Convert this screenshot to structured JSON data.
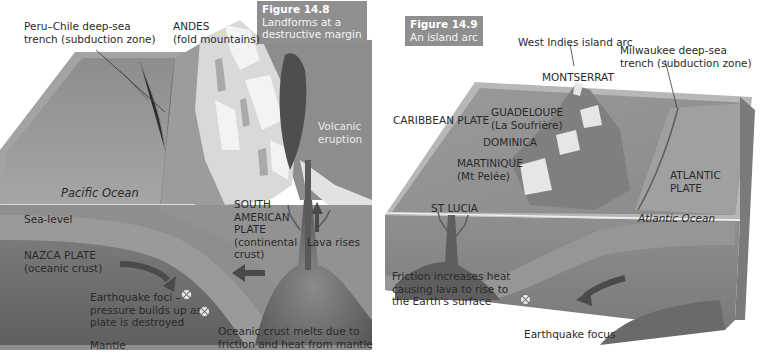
{
  "figures": [
    {
      "number": "Figure 14.8",
      "title": "Landforms at a destructive margin",
      "title_lines": [
        "Landforms at a",
        "destructive margin"
      ],
      "labels": {
        "trench": [
          "Peru–Chile deep-sea",
          "trench (subduction zone)"
        ],
        "andes": [
          "ANDES",
          "(fold mountains)"
        ],
        "volcanic": [
          "Volcanic",
          "eruption"
        ],
        "pacific_ocean": "Pacific Ocean",
        "sea_level": "Sea-level",
        "south_american_plate": [
          "SOUTH",
          "AMERICAN",
          "PLATE",
          "(continental",
          "crust)"
        ],
        "lava_rises": "Lava rises",
        "nazca_plate": [
          "NAZCA PLATE",
          "(oceanic crust)"
        ],
        "earthquake_foci": [
          "Earthquake foci –",
          "pressure builds up as",
          "plate is destroyed"
        ],
        "mantle": "Mantle",
        "oceanic_melts": [
          "Oceanic crust melts due to",
          "friction and heat from mantle"
        ]
      },
      "icons": [
        "earthquake-focus-icon",
        "earthquake-focus-icon",
        "arrow-subduction-icon",
        "arrow-west-icon",
        "arrow-up-icon"
      ]
    },
    {
      "number": "Figure 14.9",
      "title": "An island arc",
      "title_lines": [
        "An island arc"
      ],
      "labels": {
        "west_indies": "West Indies island arc",
        "milwaukee": [
          "Milwaukee deep-sea",
          "trench (subduction zone)"
        ],
        "montserrat": "MONTSERRAT",
        "caribbean_plate": "CARIBBEAN PLATE",
        "guadeloupe": [
          "GUADELOUPE",
          "(La Soufrière)"
        ],
        "dominica": "DOMINICA",
        "martinique": [
          "MARTINIQUE",
          "(Mt Pelée)"
        ],
        "st_lucia": "ST LUCIA",
        "atlantic_plate": [
          "ATLANTIC",
          "PLATE"
        ],
        "atlantic_ocean": "Atlantic Ocean",
        "friction": [
          "Friction increases heat",
          "causing lava to rise to",
          "the Earth's surface"
        ],
        "earthquake_focus": "Earthquake focus"
      },
      "icons": [
        "earthquake-focus-icon",
        "arrow-subduction-icon"
      ]
    }
  ],
  "colors": {
    "ocean_surface": "#9a9a9a",
    "block_side": "#8a8a8a",
    "mantle": "#6f6f6f",
    "caption_bg": "#8f8f8f",
    "snow": "#eeeeee",
    "magma": "#555555"
  }
}
